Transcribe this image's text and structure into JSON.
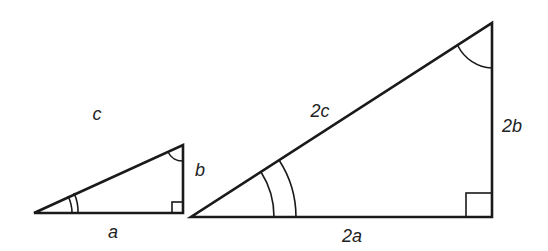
{
  "diagram": {
    "stroke_color": "#1a1a1a",
    "small_triangle": {
      "vertices": {
        "angle_vertex": [
          34,
          213
        ],
        "right_angle": [
          183,
          213
        ],
        "apex": [
          183,
          145
        ]
      },
      "labels": {
        "hypotenuse": "c",
        "vertical": "b",
        "base": "a"
      },
      "angle_marks": {
        "acute_double_arc": true,
        "apex_single_arc": true,
        "right_angle_box": true
      }
    },
    "large_triangle": {
      "vertices": {
        "angle_vertex": [
          191,
          217
        ],
        "right_angle": [
          492,
          217
        ],
        "apex": [
          492,
          23
        ]
      },
      "labels": {
        "hypotenuse": "2c",
        "vertical": "2b",
        "base": "2a"
      },
      "angle_marks": {
        "acute_double_arc": true,
        "apex_single_arc": true,
        "right_angle_box": true
      }
    }
  }
}
